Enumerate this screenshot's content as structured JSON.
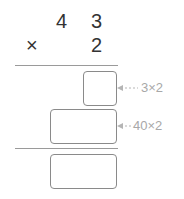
{
  "problem": {
    "multiplicand": [
      "4",
      "3"
    ],
    "operator": "×",
    "multiplier": "2"
  },
  "steps": [
    {
      "name": "ones-partial",
      "answer": "",
      "hint": "3×2"
    },
    {
      "name": "tens-partial",
      "answer": "",
      "hint": "40×2"
    }
  ],
  "result": {
    "answer": ""
  },
  "colors": {
    "text": "#333333",
    "hint": "#a8a8a8",
    "line": "#9a9a9a",
    "box_border": "#8a8a8a"
  }
}
